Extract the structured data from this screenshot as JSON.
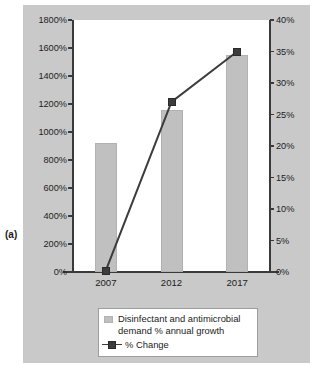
{
  "figure": {
    "sublabel": "(a)"
  },
  "chart_data": {
    "type": "bar",
    "title": "",
    "subtitle": "",
    "xlabel": "",
    "ylabel": "",
    "categories": [
      "2007",
      "2012",
      "2017"
    ],
    "grid": false,
    "legend_position": "bottom",
    "axes": {
      "left": {
        "label": "",
        "ylim": [
          0,
          1800
        ],
        "tick_step": 200,
        "tick_labels": [
          "0%",
          "200%",
          "400%",
          "600%",
          "800%",
          "1000%",
          "1200%",
          "1400%",
          "1600%",
          "1800%"
        ],
        "tick_values": [
          0,
          200,
          400,
          600,
          800,
          1000,
          1200,
          1400,
          1600,
          1800
        ]
      },
      "right": {
        "label": "",
        "ylim": [
          0,
          40
        ],
        "tick_step": 5,
        "tick_labels": [
          "0%",
          "5%",
          "10%",
          "15%",
          "20%",
          "25%",
          "30%",
          "35%",
          "40%"
        ],
        "tick_values": [
          0,
          5,
          10,
          15,
          20,
          25,
          30,
          35,
          40
        ]
      }
    },
    "series": [
      {
        "name": "Disinfectant and antimicrobial demand % annual growth",
        "type": "bar",
        "axis": "left",
        "unit": "%",
        "values": [
          920,
          1160,
          1550
        ]
      },
      {
        "name": "% Change",
        "type": "line",
        "axis": "right",
        "unit": "%",
        "values": [
          0.2,
          27,
          35
        ]
      }
    ],
    "colors": {
      "bar": "#c0c0c0",
      "line": "#3c3c3c",
      "marker": "#3c3c3c",
      "panel_background": "#c9c9c9",
      "plot_background": "#ffffff",
      "axis": "#3a3a3a",
      "text": "#1c1c1c"
    }
  },
  "legend": {
    "entries": [
      {
        "label": "Disinfectant and antimicrobial demand % annual growth",
        "marker": "bar-swatch"
      },
      {
        "label": "% Change",
        "marker": "line-marker-swatch"
      }
    ]
  }
}
